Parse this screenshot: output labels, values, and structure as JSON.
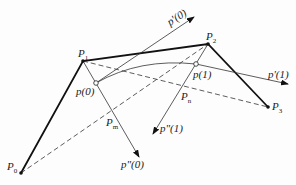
{
  "diagram": {
    "type": "cubic-curve-construction",
    "control_points": [
      {
        "name": "P0",
        "label": "P",
        "sub": "0",
        "x": 21,
        "y": 173
      },
      {
        "name": "P1",
        "label": "P",
        "sub": "1",
        "x": 83,
        "y": 61
      },
      {
        "name": "P2",
        "label": "P",
        "sub": "2",
        "x": 208,
        "y": 44
      },
      {
        "name": "P3",
        "label": "P",
        "sub": "3",
        "x": 268,
        "y": 107
      }
    ],
    "curve_points": [
      {
        "name": "p(0)",
        "label": "p(0)",
        "x": 96,
        "y": 83
      },
      {
        "name": "p(1)",
        "label": "p(1)",
        "x": 196,
        "y": 64
      }
    ],
    "midpoints": [
      {
        "name": "Pm",
        "label": "P",
        "sub": "m"
      },
      {
        "name": "Pn",
        "label": "P",
        "sub": "n"
      }
    ],
    "vectors": [
      {
        "name": "p'(0)",
        "label": "p'(0)"
      },
      {
        "name": "p'(1)",
        "label": "p'(1)"
      },
      {
        "name": "p''(0)",
        "label": "p\"(0)"
      },
      {
        "name": "p''(1)",
        "label": "p\"(1)"
      }
    ],
    "colors": {
      "line": "#111111",
      "thin": "#333333"
    }
  }
}
